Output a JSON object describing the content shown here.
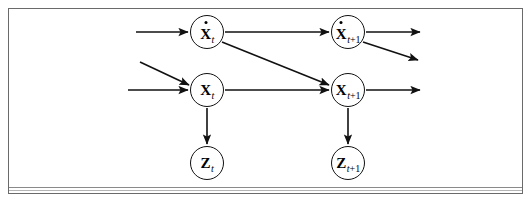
{
  "figure": {
    "type": "dynamic-bayesian-network",
    "frame": {
      "border_color": "#6a6a6a",
      "background": "#ffffff"
    },
    "rule_color": "#8a8a8a",
    "ink_color": "#111111"
  },
  "nodes": [
    {
      "id": "xdot_t",
      "name": "x-dot-t-node",
      "var": "X",
      "accent": "dot",
      "subscript": "t",
      "label_plain": "Ẋt",
      "cx": 207,
      "cy": 32,
      "r": 17
    },
    {
      "id": "xdot_t1",
      "name": "x-dot-t1-node",
      "var": "X",
      "accent": "dot",
      "subscript": "t+1",
      "label_plain": "Ẋt+1",
      "cx": 348,
      "cy": 32,
      "r": 17
    },
    {
      "id": "x_t",
      "name": "x-t-node",
      "var": "X",
      "accent": "none",
      "subscript": "t",
      "label_plain": "Xt",
      "cx": 207,
      "cy": 90,
      "r": 17
    },
    {
      "id": "x_t1",
      "name": "x-t1-node",
      "var": "X",
      "accent": "none",
      "subscript": "t+1",
      "label_plain": "Xt+1",
      "cx": 348,
      "cy": 90,
      "r": 17
    },
    {
      "id": "z_t",
      "name": "z-t-node",
      "var": "Z",
      "accent": "none",
      "subscript": "t",
      "label_plain": "Zt",
      "cx": 207,
      "cy": 163,
      "r": 17
    },
    {
      "id": "z_t1",
      "name": "z-t1-node",
      "var": "Z",
      "accent": "none",
      "subscript": "t+1",
      "label_plain": "Zt+1",
      "cx": 348,
      "cy": 163,
      "r": 17
    }
  ],
  "edges": [
    {
      "id": "in_xdot_t",
      "name": "incoming-arrow-to-x-dot-t",
      "from": [
        136,
        32
      ],
      "to": [
        188,
        32
      ],
      "arrow": true
    },
    {
      "id": "in_x_t_diag",
      "name": "incoming-diagonal-arrow-to-x-t",
      "from": [
        140,
        62
      ],
      "to": [
        189,
        85
      ],
      "arrow": true
    },
    {
      "id": "in_x_t_horiz",
      "name": "incoming-arrow-to-x-t",
      "from": [
        128,
        90
      ],
      "to": [
        188,
        90
      ],
      "arrow": true
    },
    {
      "id": "xdot_t_to_xdot_t1",
      "name": "edge-x-dot-t-to-x-dot-t1",
      "from": [
        225,
        32
      ],
      "to": [
        329,
        32
      ],
      "arrow": true
    },
    {
      "id": "xdot_t_to_x_t1",
      "name": "edge-x-dot-t-to-x-t1",
      "from": [
        222,
        42
      ],
      "to": [
        329,
        85
      ],
      "arrow": true
    },
    {
      "id": "x_t_to_x_t1",
      "name": "edge-x-t-to-x-t1",
      "from": [
        225,
        90
      ],
      "to": [
        329,
        90
      ],
      "arrow": true
    },
    {
      "id": "x_t_to_z_t",
      "name": "edge-x-t-to-z-t",
      "from": [
        207,
        108
      ],
      "to": [
        207,
        144
      ],
      "arrow": true
    },
    {
      "id": "x_t1_to_z_t1",
      "name": "edge-x-t1-to-z-t1",
      "from": [
        348,
        108
      ],
      "to": [
        348,
        144
      ],
      "arrow": true
    },
    {
      "id": "out_xdot_t1_horiz",
      "name": "outgoing-arrow-from-x-dot-t1",
      "from": [
        366,
        32
      ],
      "to": [
        420,
        32
      ],
      "arrow": true
    },
    {
      "id": "out_xdot_t1_diag",
      "name": "outgoing-diagonal-arrow-from-x-dot-t1",
      "from": [
        363,
        42
      ],
      "to": [
        418,
        60
      ],
      "arrow": true
    },
    {
      "id": "out_x_t1_horiz",
      "name": "outgoing-arrow-from-x-t1",
      "from": [
        366,
        90
      ],
      "to": [
        420,
        90
      ],
      "arrow": true
    }
  ]
}
